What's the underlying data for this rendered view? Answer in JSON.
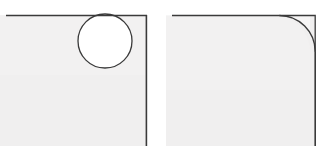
{
  "diagram": {
    "type": "technical-corner-detail",
    "canvas": {
      "width": 332,
      "height": 154
    },
    "colors": {
      "background": "#ffffff",
      "panel_fill": "#f0efef",
      "panel_fill_light": "#f4f3f3",
      "cutout_fill": "#ffffff",
      "outline": "#3a3a3a",
      "outline_soft": "#6e6e6e"
    },
    "figures": [
      {
        "id": "circular-cutout",
        "name": "Panel with circular cutout",
        "panel": {
          "x": 6,
          "y": 15,
          "width": 141,
          "height": 131,
          "corner_radius": 0,
          "edges_drawn": [
            "top",
            "right"
          ],
          "edges_bleed": [
            "left",
            "bottom"
          ]
        },
        "cutout": {
          "shape": "circle",
          "center_x": 105,
          "center_y": 41,
          "radius": 27,
          "tangent_to": "top-edge"
        }
      },
      {
        "id": "radiused-corner",
        "name": "Panel with radiused corner and removed flap",
        "panel": {
          "x": 6,
          "y": 15,
          "width": 144,
          "height": 131,
          "corner_radius": 36,
          "rounded_corner": "top-right",
          "edges_drawn": [
            "top",
            "right"
          ],
          "edges_bleed": [
            "left",
            "bottom"
          ]
        },
        "flap": {
          "shape": "square-corner-minus-arc",
          "corner_x": 150,
          "corner_y": 15,
          "radius": 36,
          "description": "residual material between square corner and arc"
        }
      }
    ]
  }
}
